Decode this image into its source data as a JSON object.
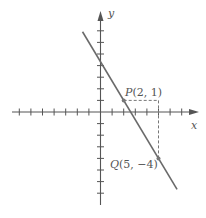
{
  "chart_data": {
    "type": "line",
    "title": "",
    "xlabel": "x",
    "ylabel": "y",
    "xlim": [
      -7,
      7
    ],
    "ylim": [
      -7,
      7
    ],
    "grid": false,
    "tick_spacing": 1,
    "series": [
      {
        "name": "line through P and Q",
        "slope": -1.6667,
        "intercept": 4.3333,
        "x": [
          -1.55,
          6.6
        ],
        "y": [
          6.92,
          -6.67
        ]
      }
    ],
    "points": [
      {
        "name": "P",
        "label": "P(2, 1)",
        "x": 2,
        "y": 1
      },
      {
        "name": "Q",
        "label": "Q(5, −4)",
        "x": 5,
        "y": -4
      }
    ],
    "annotations": [
      "dashed horizontal segment from P(2,1) to (5,1)",
      "dashed vertical segment from (5,1) to Q(5,−4)"
    ]
  },
  "labels": {
    "x_axis": "x",
    "y_axis": "y",
    "p_letter": "P",
    "p_coords": "(2, 1)",
    "q_letter": "Q",
    "q_coords": "(5, −4)"
  },
  "colors": {
    "axis": "#555555",
    "line": "#6a6a6a",
    "dashed": "#777777",
    "point": "#777777"
  }
}
